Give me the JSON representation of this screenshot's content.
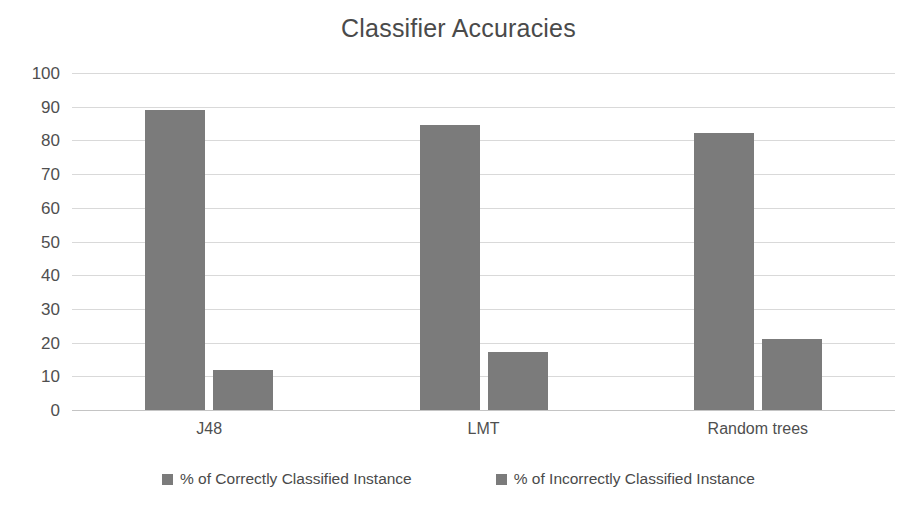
{
  "chart_data": {
    "type": "bar",
    "title": "Classifier Accuracies",
    "xlabel": "",
    "ylabel": "",
    "categories": [
      "J48",
      "LMT",
      "Random trees"
    ],
    "series": [
      {
        "name": "% of Correctly Classified Instance",
        "color": "#7b7b7b",
        "values": [
          88.9,
          84.6,
          82.2
        ]
      },
      {
        "name": "% of Incorrectly Classified Instance",
        "color": "#7b7b7b",
        "values": [
          11.9,
          17.2,
          21.1
        ]
      }
    ],
    "ylim": [
      0,
      100
    ],
    "y_ticks": [
      0,
      10,
      20,
      30,
      40,
      50,
      60,
      70,
      80,
      90,
      100
    ],
    "y_tick_labels": [
      "0",
      "10",
      "20",
      "30",
      "40",
      "50",
      "60",
      "70",
      "80",
      "90",
      "100"
    ],
    "grid": true,
    "grid_axis": "y",
    "legend_position": "bottom",
    "bar_color": "#7b7b7b",
    "gridline_color": "#d9d9d9",
    "background_color": "#ffffff",
    "title_color": "#4a4a4a"
  },
  "legend": {
    "entries": [
      {
        "label": "% of Correctly Classified Instance",
        "swatch_name": "legend-swatch-correct"
      },
      {
        "label": "% of Incorrectly Classified Instance",
        "swatch_name": "legend-swatch-incorrect"
      }
    ]
  }
}
